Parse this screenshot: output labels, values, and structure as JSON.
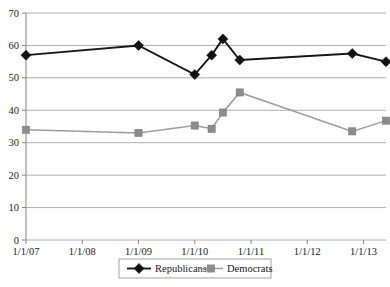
{
  "chart_data": {
    "type": "line",
    "title": "",
    "subtitle": "",
    "xlabel": "",
    "ylabel": "",
    "ylim": [
      0,
      70
    ],
    "ytick_step": 10,
    "yticks": [
      0,
      10,
      20,
      30,
      40,
      50,
      60,
      70
    ],
    "xticks": [
      "1/1/07",
      "1/1/08",
      "1/1/09",
      "1/1/10",
      "1/1/11",
      "1/1/12",
      "1/1/13"
    ],
    "x_numeric_ticks": [
      2007,
      2008,
      2009,
      2010,
      2011,
      2012,
      2013
    ],
    "xlim": [
      2007,
      2013.4
    ],
    "grid": "horizontal",
    "legend_position": "bottom",
    "series": [
      {
        "name": "Republicans",
        "color": "#121212",
        "marker": "diamond",
        "x": [
          2007.0,
          2009.0,
          2010.0,
          2010.3,
          2010.5,
          2010.8,
          2012.8,
          2013.4
        ],
        "values": [
          57,
          60,
          51,
          57,
          62,
          55.5,
          57.5,
          55
        ]
      },
      {
        "name": "Democrats",
        "color": "#8c8c8c",
        "marker": "square",
        "x": [
          2007.0,
          2009.0,
          2010.0,
          2010.3,
          2010.5,
          2010.8,
          2012.8,
          2013.4
        ],
        "values": [
          34,
          33,
          35.3,
          34.3,
          39.3,
          45.5,
          33.5,
          36.8
        ]
      }
    ],
    "legend": [
      {
        "label": "Republicans",
        "color": "#121212",
        "marker": "diamond"
      },
      {
        "label": "Democrats",
        "color": "#8c8c8c",
        "marker": "square"
      }
    ]
  }
}
